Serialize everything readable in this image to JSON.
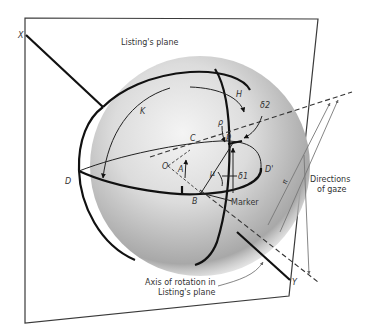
{
  "figure": {
    "title": "Listing's plane",
    "labels": {
      "X": "X",
      "Y": "Y",
      "H": "H",
      "K": "K",
      "C": "C",
      "P": "P",
      "O": "O",
      "A": "A",
      "B": "B",
      "D": "D",
      "D_prime": "D'",
      "rho": "ρ",
      "mu": "μ",
      "delta1": "δ1",
      "delta2": "δ2",
      "pi": "π"
    },
    "annotations": {
      "marker": "Marker",
      "directions_line1": "Directions",
      "directions_line2": "of gaze",
      "axis_line1": "Axis of rotation in",
      "axis_line2": "Listing's plane"
    },
    "colors": {
      "background": "#ffffff",
      "line": "#111111",
      "sphere_light": "#f2f2f2",
      "sphere_dark": "#9a9a9a",
      "text": "#333333"
    }
  }
}
